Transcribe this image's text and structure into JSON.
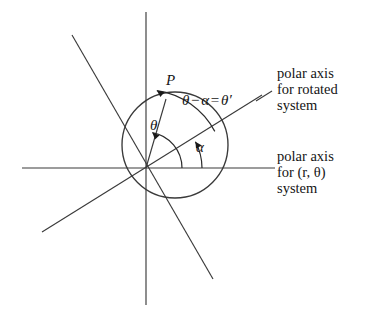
{
  "figure": {
    "domain": "diagram",
    "background_color": "#ffffff",
    "ink_color": "#2a2a2a",
    "width": 380,
    "height": 316
  },
  "labels": {
    "point_p": "P",
    "theta": "θ",
    "alpha": "α",
    "theta_minus_alpha_lhs_theta": "θ",
    "theta_minus_alpha_minus": "−",
    "theta_minus_alpha_alpha": "α",
    "theta_minus_alpha_equals": "=",
    "theta_minus_alpha_rhs": "θ′",
    "theta_minus_alpha_full": "θ − α = θ′"
  },
  "captions": {
    "rotated_axis": {
      "line1": "polar axis",
      "line2": "for rotated",
      "line3": "system"
    },
    "original_axis": {
      "line1": "polar axis",
      "line2": "for (r, θ)",
      "line3": "system"
    }
  },
  "geometry": {
    "origin": {
      "x": 146,
      "y": 168
    },
    "horizontal_axis": {
      "x1": 22,
      "y1": 168,
      "x2": 275,
      "y2": 168
    },
    "vertical_axis": {
      "x1": 146,
      "y1": 12,
      "x2": 146,
      "y2": 305
    },
    "rotated_polar_axis": {
      "x1": 42,
      "y1": 232,
      "x2": 262,
      "y2": 95,
      "angle_deg": 28
    },
    "rotated_perpendicular_axis": {
      "x1": 72,
      "y1": 35,
      "x2": 213,
      "y2": 279,
      "angle_deg": 118
    },
    "circle": {
      "cx": 175,
      "cy": 145,
      "r": 53
    },
    "point_p": {
      "x": 165,
      "y": 98
    },
    "arc_theta": {
      "radius": 36,
      "from_deg": 0,
      "to_deg": 82
    },
    "arc_alpha": {
      "radius": 56,
      "from_deg": 0,
      "to_deg": 28
    },
    "arc_theta_minus_alpha": {
      "radius": 78,
      "from_deg": 28,
      "to_deg": 82
    },
    "leader_line": {
      "x1": 258,
      "y1": 100,
      "x2": 272,
      "y2": 92
    }
  },
  "colors": {
    "stroke": "#3a3a3a",
    "text": "#151515",
    "paper": "#ffffff"
  }
}
